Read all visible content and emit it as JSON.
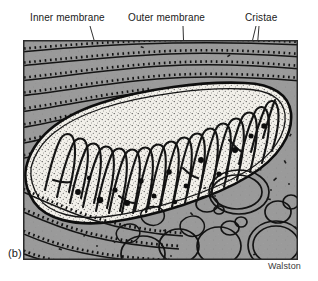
{
  "figure": {
    "panel_label": "(b)",
    "credit": "Walston"
  },
  "annotations": [
    {
      "id": "inner-membrane",
      "text": "Inner membrane",
      "x": 30,
      "y": 12,
      "leader": {
        "x1": 90,
        "y1": 26,
        "x2": 113,
        "y2": 106
      }
    },
    {
      "id": "outer-membrane",
      "text": "Outer membrane",
      "x": 128,
      "y": 12,
      "leader": {
        "x1": 183,
        "y1": 26,
        "x2": 186,
        "y2": 111
      }
    },
    {
      "id": "cristae",
      "text": "Cristae",
      "x": 245,
      "y": 12,
      "leader": {
        "x1": 256,
        "y1": 26,
        "x2": 247,
        "y2": 63
      },
      "leader2": {
        "x1": 259,
        "y1": 26,
        "x2": 256,
        "y2": 62
      }
    }
  ],
  "colors": {
    "cytoplasm": "#9a9a9a",
    "matrix": "#f2f0ea",
    "ink": "#141414",
    "border": "#2a2a2a",
    "page": "#ffffff",
    "granule": "#111111",
    "vesicle_fill": "#9e9e9e"
  },
  "frame": {
    "x": 23,
    "y": 40,
    "width": 275,
    "height": 220
  },
  "structures": {
    "mitochondrion": "large elongated organelle crossing image, light stippled matrix with dark hairpin cristae and dense granules",
    "rough_er": "stacked membrane lines studded with ribosome ticks in surrounding cytoplasm",
    "vesicles": "clear rounded vacuoles in lower-right cytoplasm",
    "ribosomes": "small dark dots and dashes scattered through cytoplasm"
  }
}
